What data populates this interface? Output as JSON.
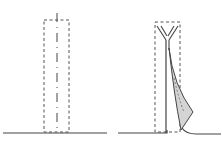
{
  "diagram": {
    "description": "Two-step folding illustration",
    "panels": [
      {
        "id": "left",
        "label": "Unfolded strip with center fold line",
        "elements": [
          "baseline",
          "dashed-outline-rectangle",
          "dash-dot-center-line"
        ]
      },
      {
        "id": "right",
        "label": "Strip folded into Y shape with shaded flap",
        "elements": [
          "baseline",
          "dashed-outline-rectangle",
          "y-fold-lines",
          "vertical-stem",
          "shaded-curved-flap"
        ]
      }
    ],
    "colors": {
      "stroke": "#444444",
      "dashed": "#555555",
      "shade": "#d4d4d4"
    }
  }
}
